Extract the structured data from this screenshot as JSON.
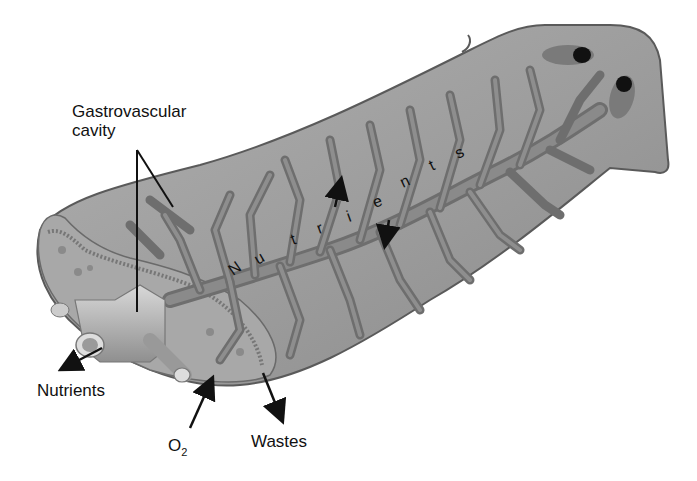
{
  "diagram": {
    "labels": {
      "gastrovascular_line1": "Gastrovascular",
      "gastrovascular_line2": "cavity",
      "nutrients_out": "Nutrients",
      "o2_main": "O",
      "o2_sub": "2",
      "wastes": "Wastes"
    },
    "internal_arc_text": [
      "N",
      "u",
      "t",
      "r",
      "i",
      "e",
      "n",
      "t",
      "s"
    ],
    "colors": {
      "body_fill": "#9e9e9e",
      "body_edge": "#5a5a5a",
      "branch_fill": "#7a7a7a",
      "branch_edge": "#4a4a4a",
      "eyespot": "#111111",
      "text": "#111111"
    }
  }
}
